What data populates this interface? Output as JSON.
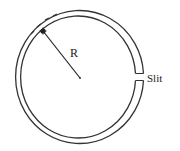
{
  "diagram": {
    "labels": {
      "radius": "R",
      "slit": "Slit"
    },
    "colors": {
      "stroke": "#333333",
      "text": "#222222",
      "background": "#ffffff"
    }
  }
}
